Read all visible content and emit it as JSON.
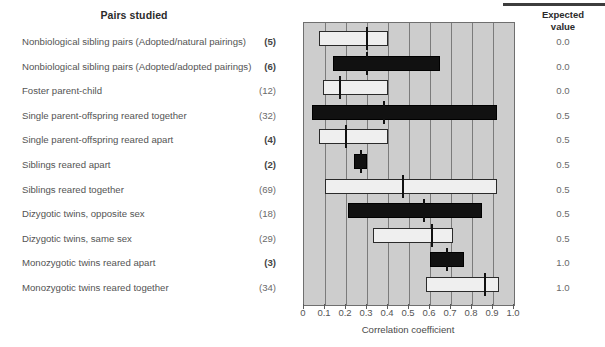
{
  "headers": {
    "pairs_studied": "Pairs studied",
    "expected_value": "Expected\nvalue",
    "expected_value_line1": "Expected",
    "expected_value_line2": "value"
  },
  "axis": {
    "title": "Correlation coefficient",
    "tick_labels": [
      "0",
      "0.1",
      "0.2",
      "0.3",
      "0.4",
      "0.5",
      "0.6",
      "0.7",
      "0.8",
      "0.9",
      "1.0"
    ]
  },
  "chart_data": {
    "type": "bar",
    "title": "Pairs studied",
    "xlabel": "Correlation coefficient",
    "ylabel": "",
    "xlim": [
      0.0,
      1.0
    ],
    "grid": true,
    "legend": "none",
    "orientation": "horizontal",
    "note": "Each bar spans the observed range of correlation coefficients; the vertical tick marks the median.",
    "columns": [
      "Pairs studied",
      "Number of studies",
      "Range low",
      "Range high",
      "Median",
      "Expected value"
    ],
    "categories": [
      "Nonbiological sibling pairs (Adopted/natural pairings)",
      "Nonbiological sibling pairs (Adopted/adopted pairings)",
      "Foster parent-child",
      "Single parent-offspring reared together",
      "Single parent-offspring reared apart",
      "Siblings reared apart",
      "Siblings reared together",
      "Dizygotic twins, opposite sex",
      "Dizygotic twins, same sex",
      "Monozygotic twins reared apart",
      "Monozygotic twins reared together"
    ],
    "rows": [
      {
        "label": "Nonbiological sibling pairs (Adopted/natural pairings)",
        "n": "(5)",
        "n_bold": true,
        "low": 0.07,
        "high": 0.4,
        "median": 0.3,
        "expected": "0.0",
        "fill": "light"
      },
      {
        "label": "Nonbiological sibling pairs (Adopted/adopted pairings)",
        "n": "(6)",
        "n_bold": true,
        "low": 0.14,
        "high": 0.65,
        "median": 0.3,
        "expected": "0.0",
        "fill": "dark"
      },
      {
        "label": "Foster parent-child",
        "n": "(12)",
        "n_bold": false,
        "low": 0.09,
        "high": 0.4,
        "median": 0.17,
        "expected": "0.0",
        "fill": "light"
      },
      {
        "label": "Single parent-offspring reared together",
        "n": "(32)",
        "n_bold": false,
        "low": 0.04,
        "high": 0.92,
        "median": 0.38,
        "expected": "0.5",
        "fill": "dark"
      },
      {
        "label": "Single parent-offspring reared apart",
        "n": "(4)",
        "n_bold": true,
        "low": 0.07,
        "high": 0.4,
        "median": 0.2,
        "expected": "0.5",
        "fill": "light"
      },
      {
        "label": "Siblings reared apart",
        "n": "(2)",
        "n_bold": true,
        "low": 0.24,
        "high": 0.3,
        "median": 0.27,
        "expected": "0.5",
        "fill": "dark"
      },
      {
        "label": "Siblings reared together",
        "n": "(69)",
        "n_bold": false,
        "low": 0.1,
        "high": 0.92,
        "median": 0.47,
        "expected": "0.5",
        "fill": "light"
      },
      {
        "label": "Dizygotic twins, opposite sex",
        "n": "(18)",
        "n_bold": false,
        "low": 0.21,
        "high": 0.85,
        "median": 0.57,
        "expected": "0.5",
        "fill": "dark"
      },
      {
        "label": "Dizygotic twins, same sex",
        "n": "(29)",
        "n_bold": false,
        "low": 0.33,
        "high": 0.71,
        "median": 0.61,
        "expected": "0.5",
        "fill": "light"
      },
      {
        "label": "Monozygotic twins reared apart",
        "n": "(3)",
        "n_bold": true,
        "low": 0.6,
        "high": 0.76,
        "median": 0.68,
        "expected": "1.0",
        "fill": "dark"
      },
      {
        "label": "Monozygotic twins reared together",
        "n": "(34)",
        "n_bold": false,
        "low": 0.58,
        "high": 0.93,
        "median": 0.86,
        "expected": "1.0",
        "fill": "light"
      }
    ]
  },
  "colors": {
    "plot_background": "#cdcdcd",
    "bar_light": "#efefef",
    "bar_dark": "#111111",
    "gridline": "#7b7b7b",
    "frame": "#6f6f6f"
  }
}
